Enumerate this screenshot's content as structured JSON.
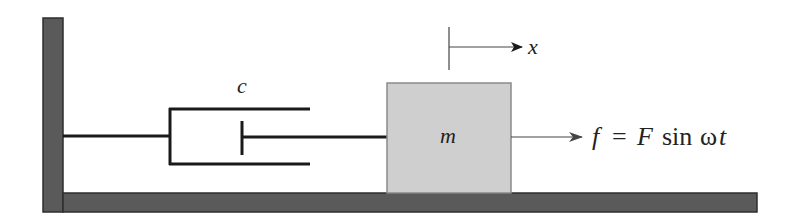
{
  "diagram": {
    "colors": {
      "ground": "#5a5a5a",
      "ground_border": "#2e2e2e",
      "mass_fill": "#cfcfcf",
      "mass_border": "#8a8a8a",
      "line": "#1a1a1a",
      "arrow": "#444444"
    },
    "labels": {
      "damper": "c",
      "mass": "m",
      "displacement": "x",
      "force_f": "f",
      "force_eq": "=",
      "force_F": "F",
      "force_sin": "sin",
      "force_omega": "ω",
      "force_t": "t"
    },
    "components": [
      "wall",
      "floor",
      "damper",
      "mass",
      "displacement-arrow",
      "force-arrow"
    ]
  }
}
